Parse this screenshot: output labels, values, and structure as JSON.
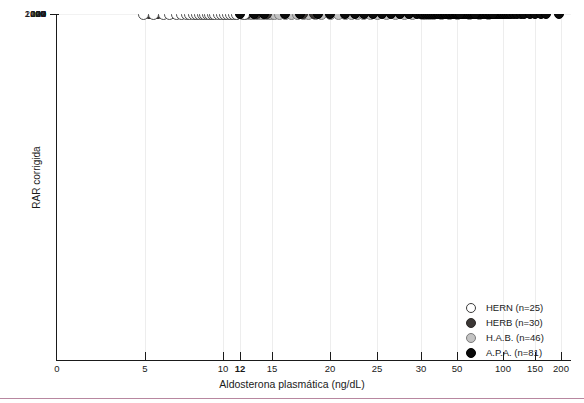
{
  "chart_data": {
    "type": "scatter",
    "title": "",
    "xlabel": "Aldosterona plasmática (ng/dL)",
    "ylabel": "RAR corrigida",
    "xscale": "log",
    "yscale": "log",
    "xlim": [
      0,
      200
    ],
    "ylim": [
      1,
      2000
    ],
    "grid": true,
    "legend_position": "bottom-right",
    "xticks": [
      {
        "value": 0,
        "label": "0",
        "bold": false
      },
      {
        "value": 5,
        "label": "5",
        "bold": false
      },
      {
        "value": 10,
        "label": "10",
        "bold": false
      },
      {
        "value": 12,
        "label": "12",
        "bold": true
      },
      {
        "value": 15,
        "label": "15",
        "bold": false
      },
      {
        "value": 20,
        "label": "20",
        "bold": false
      },
      {
        "value": 25,
        "label": "25",
        "bold": false
      },
      {
        "value": 30,
        "label": "30",
        "bold": false
      },
      {
        "value": 50,
        "label": "50",
        "bold": false
      },
      {
        "value": 100,
        "label": "100",
        "bold": false
      },
      {
        "value": 150,
        "label": "150",
        "bold": false
      },
      {
        "value": 200,
        "label": "200",
        "bold": false
      }
    ],
    "yticks": [
      {
        "value": 2000,
        "label": "2000",
        "bold": false
      },
      {
        "value": 1000,
        "label": "1000",
        "bold": false
      },
      {
        "value": 400,
        "label": "400",
        "bold": false
      },
      {
        "value": 200,
        "label": "200",
        "bold": false
      },
      {
        "value": 100,
        "label": "100",
        "bold": false
      },
      {
        "value": 40,
        "label": "40",
        "bold": false
      },
      {
        "value": 27,
        "label": "27",
        "bold": true
      },
      {
        "value": 20,
        "label": "20",
        "bold": false
      },
      {
        "value": 10,
        "label": "10",
        "bold": false
      },
      {
        "value": 4,
        "label": "4",
        "bold": false
      },
      {
        "value": 2,
        "label": "2",
        "bold": false
      },
      {
        "value": 1,
        "label": "1",
        "bold": false
      }
    ],
    "thresholds": {
      "x_cutoff": 12,
      "y_cutoff": 27
    },
    "shaded_regions": [
      {
        "name": "low-aldosterone-high-rar",
        "x": [
          0,
          12
        ],
        "y": [
          27,
          2000
        ]
      },
      {
        "name": "high-aldosterone-low-rar",
        "x": [
          12,
          200
        ],
        "y": [
          1,
          27
        ]
      }
    ],
    "series": [
      {
        "name": "HERN (n=25)",
        "key": "HERN",
        "n": 25,
        "color": "#ffffff",
        "points": [
          [
            3.6,
            3.7
          ],
          [
            5.4,
            6.6
          ],
          [
            5.9,
            7.2
          ],
          [
            6.2,
            5.6
          ],
          [
            6.6,
            6.1
          ],
          [
            6.9,
            7.5
          ],
          [
            7.2,
            6.4
          ],
          [
            7.4,
            5.2
          ],
          [
            7.7,
            7.0
          ],
          [
            7.9,
            5.9
          ],
          [
            8.1,
            6.8
          ],
          [
            8.3,
            4.6
          ],
          [
            8.5,
            6.3
          ],
          [
            8.7,
            5.0
          ],
          [
            8.9,
            7.3
          ],
          [
            9.1,
            4.2
          ],
          [
            9.3,
            6.0
          ],
          [
            9.6,
            7.6
          ],
          [
            9.9,
            6.7
          ],
          [
            10.2,
            7.8
          ],
          [
            10.5,
            6.2
          ],
          [
            10.8,
            7.4
          ],
          [
            11.2,
            8.0
          ],
          [
            11.6,
            7.1
          ],
          [
            12.4,
            7.9
          ]
        ]
      },
      {
        "name": "HERB (n=30)",
        "key": "HERB",
        "n": 30,
        "color": "#3b3735",
        "points": [
          [
            4.0,
            17.0
          ],
          [
            5.2,
            22.0
          ],
          [
            5.6,
            19.0
          ],
          [
            6.0,
            27.5
          ],
          [
            6.4,
            21.0
          ],
          [
            6.7,
            10.5
          ],
          [
            7.0,
            9.8
          ],
          [
            7.3,
            18.5
          ],
          [
            7.5,
            24.0
          ],
          [
            7.8,
            16.0
          ],
          [
            8.0,
            19.5
          ],
          [
            8.2,
            10.0
          ],
          [
            8.4,
            9.2
          ],
          [
            8.6,
            22.5
          ],
          [
            8.8,
            17.5
          ],
          [
            9.0,
            10.8
          ],
          [
            9.2,
            20.0
          ],
          [
            9.5,
            11.5
          ],
          [
            9.8,
            26.0
          ],
          [
            10.1,
            12.0
          ],
          [
            10.4,
            21.5
          ],
          [
            10.7,
            11.0
          ],
          [
            11.0,
            14.5
          ],
          [
            11.4,
            19.0
          ],
          [
            11.8,
            13.5
          ],
          [
            12.6,
            41.0
          ],
          [
            13.5,
            30.0
          ],
          [
            14.5,
            28.0
          ],
          [
            17.5,
            21.0
          ],
          [
            18.5,
            22.5
          ]
        ]
      },
      {
        "name": "H.A.B. (n=46)",
        "key": "HAB",
        "n": 46,
        "color": "#c3c3c3",
        "points": [
          [
            7.8,
            28.0
          ],
          [
            9.0,
            31.0
          ],
          [
            10.2,
            33.0
          ],
          [
            11.0,
            38.0
          ],
          [
            11.6,
            46.0
          ],
          [
            12.2,
            42.0
          ],
          [
            12.5,
            55.0
          ],
          [
            12.8,
            60.0
          ],
          [
            13.1,
            68.0
          ],
          [
            13.4,
            52.0
          ],
          [
            13.7,
            73.0
          ],
          [
            14.0,
            44.0
          ],
          [
            14.3,
            64.0
          ],
          [
            14.6,
            57.0
          ],
          [
            14.9,
            36.0
          ],
          [
            15.2,
            70.0
          ],
          [
            15.6,
            33.0
          ],
          [
            16.0,
            48.0
          ],
          [
            16.5,
            150.0
          ],
          [
            17.0,
            24.0
          ],
          [
            17.5,
            62.0
          ],
          [
            18.0,
            74.0
          ],
          [
            18.6,
            26.0
          ],
          [
            19.2,
            36.0
          ],
          [
            20.0,
            66.0
          ],
          [
            20.8,
            95.0
          ],
          [
            21.5,
            80.0
          ],
          [
            22.2,
            63.0
          ],
          [
            22.8,
            50.0
          ],
          [
            23.5,
            103.0
          ],
          [
            24.2,
            85.0
          ],
          [
            25.0,
            110.0
          ],
          [
            26.0,
            92.0
          ],
          [
            27.0,
            70.0
          ],
          [
            28.0,
            120.0
          ],
          [
            29.0,
            78.0
          ],
          [
            30.5,
            125.0
          ],
          [
            32.0,
            145.0
          ],
          [
            34.0,
            165.0
          ],
          [
            36.0,
            135.0
          ],
          [
            40.0,
            115.0
          ],
          [
            45.0,
            200.0
          ],
          [
            50.0,
            190.0
          ],
          [
            60.0,
            250.0
          ],
          [
            70.0,
            330.0
          ],
          [
            80.0,
            400.0
          ]
        ]
      },
      {
        "name": "A.P.A. (n=81)",
        "key": "APA",
        "n": 81,
        "color": "#0a0a0a",
        "points": [
          [
            12.0,
            40.0
          ],
          [
            13.2,
            72.0
          ],
          [
            14.2,
            74.0
          ],
          [
            16.0,
            66.0
          ],
          [
            17.2,
            130.0
          ],
          [
            18.8,
            58.0
          ],
          [
            20.0,
            76.0
          ],
          [
            21.5,
            80.0
          ],
          [
            22.5,
            42.0
          ],
          [
            23.5,
            112.0
          ],
          [
            24.5,
            130.0
          ],
          [
            25.5,
            120.0
          ],
          [
            26.5,
            150.0
          ],
          [
            27.5,
            125.0
          ],
          [
            28.5,
            160.0
          ],
          [
            29.5,
            140.0
          ],
          [
            30.0,
            105.0
          ],
          [
            31.0,
            155.0
          ],
          [
            32.0,
            98.0
          ],
          [
            33.0,
            175.0
          ],
          [
            34.0,
            86.0
          ],
          [
            35.0,
            185.0
          ],
          [
            36.0,
            120.0
          ],
          [
            37.0,
            200.0
          ],
          [
            38.0,
            108.0
          ],
          [
            39.0,
            145.0
          ],
          [
            40.0,
            95.0
          ],
          [
            41.0,
            215.0
          ],
          [
            42.0,
            132.0
          ],
          [
            43.0,
            170.0
          ],
          [
            44.0,
            115.0
          ],
          [
            45.0,
            235.0
          ],
          [
            46.0,
            142.0
          ],
          [
            47.0,
            190.0
          ],
          [
            48.0,
            125.0
          ],
          [
            49.0,
            100.0
          ],
          [
            50.0,
            250.0
          ],
          [
            51.0,
            160.0
          ],
          [
            52.0,
            210.0
          ],
          [
            53.0,
            135.0
          ],
          [
            54.0,
            112.0
          ],
          [
            55.0,
            275.0
          ],
          [
            56.0,
            180.0
          ],
          [
            58.0,
            230.0
          ],
          [
            60.0,
            150.0
          ],
          [
            62.0,
            300.0
          ],
          [
            64.0,
            195.0
          ],
          [
            66.0,
            260.0
          ],
          [
            68.0,
            165.0
          ],
          [
            70.0,
            330.0
          ],
          [
            72.0,
            215.0
          ],
          [
            74.0,
            285.0
          ],
          [
            76.0,
            185.0
          ],
          [
            78.0,
            360.0
          ],
          [
            80.0,
            240.0
          ],
          [
            82.0,
            310.0
          ],
          [
            84.0,
            205.0
          ],
          [
            86.0,
            390.0
          ],
          [
            88.0,
            265.0
          ],
          [
            90.0,
            340.0
          ],
          [
            92.0,
            225.0
          ],
          [
            94.0,
            430.0
          ],
          [
            96.0,
            290.0
          ],
          [
            98.0,
            370.0
          ],
          [
            100.0,
            480.0
          ],
          [
            102.0,
            250.0
          ],
          [
            105.0,
            420.0
          ],
          [
            108.0,
            320.0
          ],
          [
            110.0,
            530.0
          ],
          [
            115.0,
            460.0
          ],
          [
            120.0,
            600.0
          ],
          [
            125.0,
            410.0
          ],
          [
            130.0,
            520.0
          ],
          [
            140.0,
            470.0
          ],
          [
            150.0,
            560.0
          ],
          [
            160.0,
            490.0
          ],
          [
            170.0,
            580.0
          ],
          [
            195.0,
            1500.0
          ],
          [
            86.0,
            170.0
          ],
          [
            66.0,
            60.0
          ],
          [
            52.0,
            62.0
          ]
        ]
      }
    ]
  },
  "legend": {
    "items": [
      {
        "label": "HERN (n=25)",
        "key": "HERN"
      },
      {
        "label": "HERB (n=30)",
        "key": "HERB"
      },
      {
        "label": "H.A.B. (n=46)",
        "key": "HAB"
      },
      {
        "label": "A.P.A. (n=81)",
        "key": "APA"
      }
    ]
  },
  "colors": {
    "shade": "#e4e4e4",
    "axis": "#1a1a1a",
    "grid": "#f2f2f2",
    "rule": "#b887a0"
  }
}
